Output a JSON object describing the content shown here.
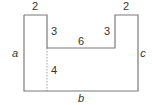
{
  "diagram": {
    "type": "composite-rectilinear-figure",
    "colors": {
      "stroke": "#7a7a7a",
      "text": "#333333",
      "dashed": "#8a8a8a"
    },
    "labels": {
      "top_left_width": "2",
      "top_right_width": "2",
      "left_notch_height": "3",
      "right_notch_height": "3",
      "inner_bottom_width": "6",
      "dashed_segment_height": "4",
      "left_side": "a",
      "right_side": "c",
      "bottom_side": "b"
    }
  }
}
